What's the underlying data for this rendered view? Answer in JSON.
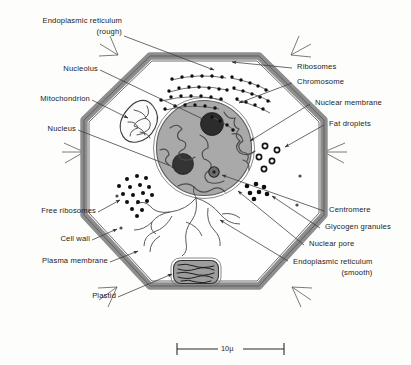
{
  "figure": {
    "kind": "cell-diagram",
    "organism_hint": "generalized plant cell",
    "background_color": "#fdfdfc",
    "ink_color": "#1b1b1b"
  },
  "colors": {
    "cell_wall": "#8c8c8c",
    "cell_wall_edge": "#4a4a4a",
    "cytoplasm": "#fefefe",
    "nucleus_fill": "#a8a8a8",
    "nucleus_edge": "#5a5a5a",
    "nucleolus": "#2e2e2e",
    "chromosome": "#4f4f4f",
    "ribosome_dot": "#111111",
    "organelle_outline": "#3c3c3c",
    "plastid_fill": "#9b9b9b",
    "leader_line": "#3a3a3a"
  },
  "labels_left": [
    {
      "id": "rough-er",
      "line1": "Endoplasmic reticulum",
      "line2": "(rough)"
    },
    {
      "id": "nucleolus",
      "line1": "Nucleolus",
      "line2": ""
    },
    {
      "id": "mitochondrion",
      "line1": "Mitochondrion",
      "line2": ""
    },
    {
      "id": "nucleus",
      "line1": "Nucleus",
      "line2": ""
    },
    {
      "id": "free-ribosomes",
      "line1": "Free ribosomes",
      "line2": ""
    },
    {
      "id": "cell-wall",
      "line1": "Cell wall",
      "line2": ""
    },
    {
      "id": "plasma-membrane",
      "line1": "Plasma membrane",
      "line2": ""
    },
    {
      "id": "plastid",
      "line1": "Plastid",
      "line2": ""
    }
  ],
  "labels_right": [
    {
      "id": "ribosomes",
      "line1": "Ribosomes",
      "line2": ""
    },
    {
      "id": "chromosome",
      "line1": "Chromosome",
      "line2": ""
    },
    {
      "id": "nuclear-membrane",
      "line1": "Nuclear membrane",
      "line2": ""
    },
    {
      "id": "fat-droplets",
      "line1": "Fat droplets",
      "line2": ""
    },
    {
      "id": "centromere",
      "line1": "Centromere",
      "line2": ""
    },
    {
      "id": "glycogen-granules",
      "line1": "Glycogen granules",
      "line2": ""
    },
    {
      "id": "nuclear-pore",
      "line1": "Nuclear pore",
      "line2": ""
    },
    {
      "id": "smooth-er",
      "line1": "Endoplasmic reticulum",
      "line2": "(smooth)"
    }
  ],
  "scale_bar": {
    "value": "10",
    "unit": "µ",
    "text": "10µ"
  },
  "structures": {
    "nucleus": {
      "cx": 204,
      "cy": 148,
      "r": 48,
      "nucleoli": 2
    },
    "rough_er_ribosome_rows": 6,
    "free_ribosome_count": 17,
    "glycogen_granule_count": 7,
    "fat_droplet_count": 5,
    "mitochondrion_count": 1,
    "plastid_count": 1
  }
}
